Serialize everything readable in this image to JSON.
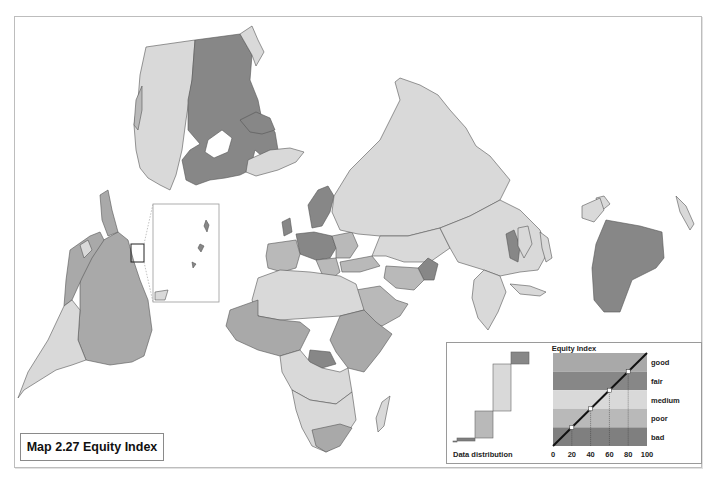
{
  "map": {
    "title": "Map 2.27 Equity Index",
    "categories": [
      {
        "key": "good",
        "label": "good",
        "color": "#a9a9a9"
      },
      {
        "key": "fair",
        "label": "fair",
        "color": "#878787"
      },
      {
        "key": "medium",
        "label": "medium",
        "color": "#d9d9d9"
      },
      {
        "key": "poor",
        "label": "poor",
        "color": "#b9b9b9"
      },
      {
        "key": "bad",
        "label": "bad",
        "color": "#7f7f7f"
      }
    ],
    "regions": [
      {
        "name": "Canada",
        "category": "fair"
      },
      {
        "name": "United States",
        "category": "medium"
      },
      {
        "name": "Alaska",
        "category": "medium"
      },
      {
        "name": "Greenland",
        "category": "medium"
      },
      {
        "name": "Russia",
        "category": "medium"
      },
      {
        "name": "Central Asia",
        "category": "medium"
      },
      {
        "name": "China",
        "category": "medium"
      },
      {
        "name": "Scandinavia",
        "category": "fair"
      },
      {
        "name": "Western Europe",
        "category": "fair"
      },
      {
        "name": "Southern Europe",
        "category": "poor"
      },
      {
        "name": "Afghanistan",
        "category": "fair"
      },
      {
        "name": "Middle East",
        "category": "poor"
      },
      {
        "name": "India",
        "category": "medium"
      },
      {
        "name": "Southeast Asia",
        "category": "medium"
      },
      {
        "name": "Myanmar",
        "category": "fair"
      },
      {
        "name": "Australia",
        "category": "fair"
      },
      {
        "name": "New Zealand",
        "category": "medium"
      },
      {
        "name": "Brazil",
        "category": "good"
      },
      {
        "name": "Western South America",
        "category": "good"
      },
      {
        "name": "Argentina",
        "category": "medium"
      },
      {
        "name": "North Africa",
        "category": "medium"
      },
      {
        "name": "West Africa",
        "category": "good"
      },
      {
        "name": "Central African Republic",
        "category": "fair"
      },
      {
        "name": "East Africa",
        "category": "good"
      },
      {
        "name": "Southern Africa",
        "category": "medium"
      },
      {
        "name": "Madagascar",
        "category": "medium"
      }
    ]
  },
  "legend": {
    "title": "Equity Index",
    "distribution_label": "Data distribution",
    "bands": [
      "good",
      "fair",
      "medium",
      "poor",
      "bad"
    ],
    "band_colors_top_to_bottom": [
      "#a9a9a9",
      "#878787",
      "#d9d9d9",
      "#b9b9b9",
      "#7f7f7f"
    ],
    "x_ticks": [
      "0",
      "20",
      "40",
      "60",
      "80",
      "100"
    ],
    "band_breaks": [
      20,
      40,
      60,
      80
    ],
    "distribution_percent": [
      {
        "band": "none",
        "share": 1,
        "color": "#7f7f7f"
      },
      {
        "band": "bad",
        "share": 3,
        "color": "#7f7f7f"
      },
      {
        "band": "poor",
        "share": 27,
        "color": "#b9b9b9"
      },
      {
        "band": "medium",
        "share": 47,
        "color": "#d9d9d9"
      },
      {
        "band": "fair",
        "share": 12,
        "color": "#878787"
      }
    ]
  }
}
